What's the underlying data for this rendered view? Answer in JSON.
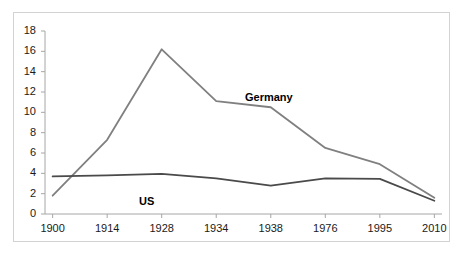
{
  "chart_data": {
    "type": "line",
    "title": "",
    "subtitle": "",
    "xlabel": "",
    "ylabel": "",
    "categories": [
      "1900",
      "1914",
      "1928",
      "1934",
      "1938",
      "1976",
      "1995",
      "2010"
    ],
    "x": [
      1900,
      1914,
      1928,
      1934,
      1938,
      1976,
      1995,
      2010
    ],
    "series": [
      {
        "name": "Germany",
        "color": "#808080",
        "values": [
          1.8,
          7.3,
          16.2,
          11.1,
          10.5,
          6.5,
          4.9,
          1.6
        ]
      },
      {
        "name": "US",
        "color": "#4a4a4a",
        "values": [
          3.7,
          3.8,
          3.95,
          3.5,
          2.8,
          3.5,
          3.45,
          1.3
        ]
      }
    ],
    "ylim": [
      0,
      18
    ],
    "yticks": [
      0,
      2,
      4,
      6,
      8,
      10,
      12,
      14,
      16,
      18
    ],
    "ytick_labels": [
      "0",
      "2",
      "4",
      "6",
      "8",
      "10",
      "12",
      "14",
      "16",
      "18"
    ],
    "grid": false,
    "legend_position": "inline-annotations",
    "annotations": [
      {
        "text": "Germany",
        "series": "Germany"
      },
      {
        "text": "US",
        "series": "US"
      }
    ],
    "axis_color": "#a6a6a6",
    "frame_color": "#d3d3d3",
    "background": "#ffffff"
  }
}
